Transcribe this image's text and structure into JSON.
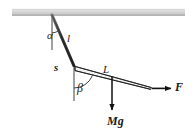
{
  "figure": {
    "background_color": "#ffffff",
    "stroke_color": "#1a1a1a",
    "ceiling": {
      "name": "ceiling-hatch-bar",
      "fill_color": "#d4d4d4",
      "edge_color": "#8a8a8a",
      "x": 12,
      "y": 9,
      "width": 173,
      "height": 6
    },
    "labels": {
      "alpha": "α",
      "string_length": "l",
      "s": "s",
      "beta": "β",
      "rod_length": "L",
      "force": "F",
      "weight": "Mg"
    },
    "geometry": {
      "anchor_point": {
        "x": 52,
        "y": 15
      },
      "joint_point": {
        "x": 74,
        "y": 66
      },
      "rod_tip_point": {
        "x": 150,
        "y": 88
      },
      "force_arrow_start": {
        "x": 152,
        "y": 88
      },
      "force_arrow_end": {
        "x": 173,
        "y": 88
      },
      "weight_arrow_start": {
        "x": 112,
        "y": 75
      },
      "weight_arrow_end": {
        "x": 112,
        "y": 112
      },
      "alpha_vertical_end": {
        "x": 52,
        "y": 50
      },
      "beta_vertical_end": {
        "x": 74,
        "y": 100
      }
    },
    "angles": {
      "alpha_description": "angle between vertical reference and string",
      "beta_description": "angle between vertical reference and rod"
    }
  }
}
